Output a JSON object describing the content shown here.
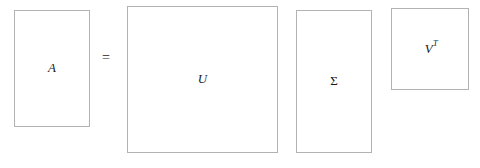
{
  "figure": {
    "background_color": "#ffffff",
    "border_color": "#b2b2b2",
    "text_color": "#1a1a1a"
  },
  "equation": {
    "operator": "="
  },
  "matrices": [
    {
      "id": "A",
      "label": "A",
      "role": "original-matrix",
      "shape_hint": "tall-rectangle"
    },
    {
      "id": "U",
      "label": "U",
      "role": "left-singular-vectors",
      "shape_hint": "large-square"
    },
    {
      "id": "Sigma",
      "label": "Σ",
      "role": "singular-values",
      "shape_hint": "tall-rectangle"
    },
    {
      "id": "VT",
      "label_base": "V",
      "label_exponent": "T",
      "role": "right-singular-vectors-transposed",
      "shape_hint": "small-square"
    }
  ]
}
